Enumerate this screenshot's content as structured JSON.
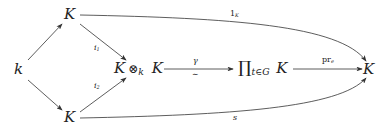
{
  "nodes": {
    "k": "k",
    "top_K": "K",
    "bottom_K": "K",
    "tensor_left": "K",
    "tensor_op": "⊗",
    "tensor_sub": "k",
    "tensor_right": "K",
    "prod_symbol": "∏",
    "prod_sub": "t∈G",
    "prod_K": "K",
    "target_K": "K"
  },
  "labels": {
    "i1": "i",
    "i1_sub": "1",
    "i2": "i",
    "i2_sub": "2",
    "gamma": "γ",
    "iso": "∼",
    "pr": "pr",
    "pr_sub": "e",
    "one": "1",
    "one_sub": "K",
    "s": "s"
  },
  "colors": {
    "stroke": "#333333",
    "text": "#222222"
  }
}
